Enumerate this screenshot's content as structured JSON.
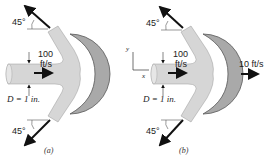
{
  "figure_a": {
    "caption": "(a)",
    "angle_top": "45°",
    "angle_bottom": "45°",
    "velocity_value": "100",
    "velocity_unit": "ft/s",
    "diameter_label": "D = 1 in."
  },
  "figure_b": {
    "caption": "(b)",
    "angle_top": "45°",
    "angle_bottom": "45°",
    "velocity_value": "100",
    "velocity_unit": "ft/s",
    "vane_velocity": "10 ft/s",
    "diameter_label": "D = 1 in.",
    "axis_y": "y",
    "axis_x": "x"
  },
  "colors": {
    "jet": "#d6d6d6",
    "vane": "#a9a9a9",
    "vane_edge": "#555555",
    "arrow": "#111111"
  }
}
